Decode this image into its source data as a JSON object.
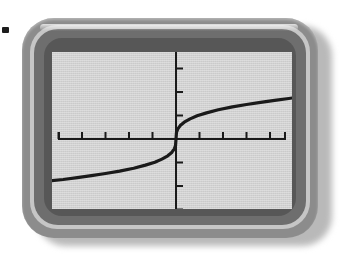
{
  "device": {
    "name": "graphing-calculator",
    "bullet_marker": "▪",
    "colors": {
      "shell": "#8c8c8c",
      "ring_light": "#c6c6c6",
      "bezel": "#6e6e6e",
      "bezel_inner": "#575757",
      "screen": "#d4d4d4",
      "ink": "#1a1a1a",
      "shadow": "#b9b9b9"
    }
  },
  "chart_data": {
    "type": "line",
    "title": "",
    "subtitle": "",
    "xlabel": "",
    "ylabel": "",
    "function": "y = x^(1/3)",
    "grid": false,
    "legend": null,
    "axes": {
      "x_axis_visible": true,
      "y_axis_visible": true,
      "x_origin_px": 176,
      "y_origin_px": 139,
      "tick_spacing_px": 23.5,
      "x_tick_count_left": 5,
      "x_tick_count_right": 5,
      "y_tick_count_up": 4,
      "y_tick_count_down": 4,
      "tick_length_px": 7
    },
    "xlim": [
      -5.3,
      5.0
    ],
    "ylim": [
      -3.6,
      3.5
    ],
    "x": [
      -5.3,
      -4.8,
      -4.2,
      -3.6,
      -3.0,
      -2.4,
      -1.8,
      -1.3,
      -0.9,
      -0.6,
      -0.35,
      -0.18,
      -0.07,
      -0.02,
      0,
      0.02,
      0.07,
      0.18,
      0.35,
      0.6,
      0.9,
      1.3,
      1.8,
      2.4,
      3.0,
      3.6,
      4.2,
      4.8,
      5.0
    ],
    "y": [
      -1.74,
      -1.69,
      -1.61,
      -1.53,
      -1.44,
      -1.34,
      -1.22,
      -1.09,
      -0.97,
      -0.84,
      -0.7,
      -0.56,
      -0.41,
      -0.27,
      0,
      0.27,
      0.41,
      0.56,
      0.7,
      0.84,
      0.97,
      1.09,
      1.22,
      1.34,
      1.44,
      1.53,
      1.61,
      1.69,
      1.72
    ],
    "curve_endpoints": {
      "left_px": [
        58,
        193
      ],
      "right_px": [
        292,
        84
      ]
    },
    "stroke_color": "#1a1a1a",
    "stroke_width_px": 3.2
  }
}
